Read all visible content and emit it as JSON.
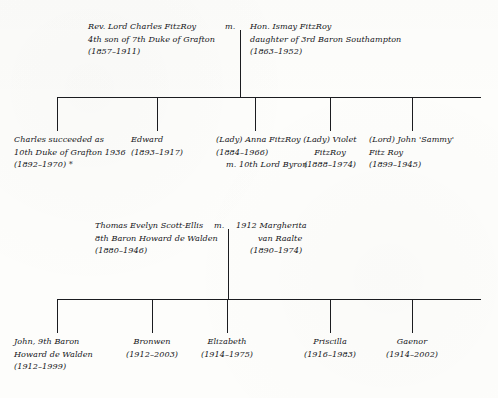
{
  "page": {
    "background_color": "#fdfdfb",
    "ink_color": "#15161a",
    "line_color": "#1b1c20"
  },
  "generation1": {
    "marriage_symbol": "m.",
    "father": {
      "name": "Rev. Lord Charles FitzRoy",
      "description": "4th son of 7th Duke of Grafton",
      "dates": "(1857–1911)"
    },
    "mother": {
      "name": "Hon. Ismay FitzRoy",
      "description": "daughter of 3rd Baron Southampton",
      "dates": "(1863–1952)"
    }
  },
  "generation2": {
    "children": [
      {
        "name": "Charles succeeded as",
        "line2": "10th Duke of Grafton 1936",
        "dates": "(1892–1970)  *",
        "line4": ""
      },
      {
        "name": "Edward",
        "line2": "(1893–1917)",
        "dates": "",
        "line4": ""
      },
      {
        "name": "(Lady) Anna FitzRoy",
        "line2": "(1884–1966)",
        "dates": "m. 10th Lord Byron",
        "line4": ""
      },
      {
        "name": "(Lady) Violet",
        "line2": "FitzRoy",
        "dates": "(1888–1974)",
        "line4": ""
      },
      {
        "name": "(Lord) John 'Sammy'",
        "line2": "Fitz Roy",
        "dates": "(1899–1945)",
        "line4": ""
      }
    ]
  },
  "generation3": {
    "marriage_symbol": "m.",
    "father": {
      "name": "Thomas Evelyn Scott-Ellis",
      "description": "8th Baron Howard de Walden",
      "dates": "(1880–1946)"
    },
    "mother": {
      "name": "1912 Margherita",
      "description": "van Raalte",
      "dates": "(1890–1974)"
    }
  },
  "generation4": {
    "children": [
      {
        "name": "John, 9th Baron",
        "line2": "Howard de Walden",
        "dates": "(1912–1999)"
      },
      {
        "name": "Bronwen",
        "line2": "(1912–2003)",
        "dates": ""
      },
      {
        "name": "Elizabeth",
        "line2": "(1914–1975)",
        "dates": ""
      },
      {
        "name": "Priscilla",
        "line2": "(1916–1983)",
        "dates": ""
      },
      {
        "name": "Gaenor",
        "line2": "(1914–2002)",
        "dates": ""
      }
    ]
  }
}
